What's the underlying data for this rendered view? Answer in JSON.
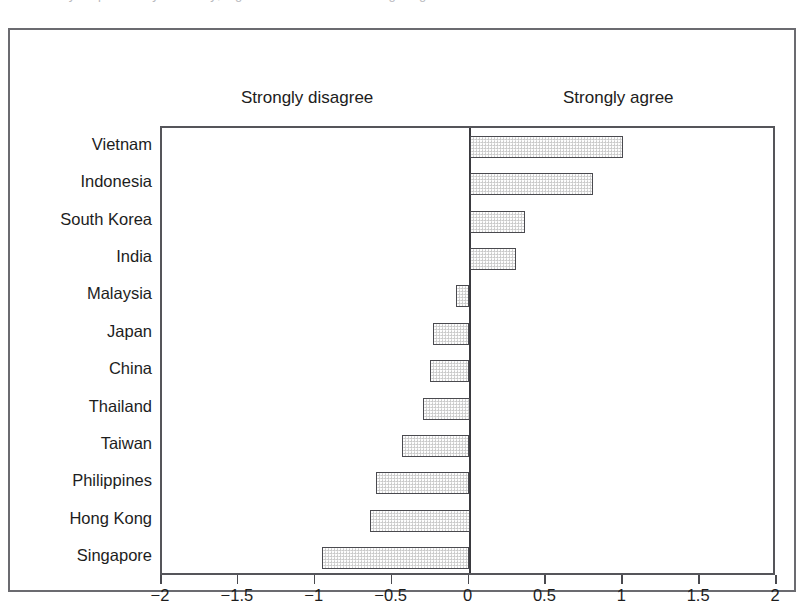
{
  "caption_sliver": "survey responses by economy; higher values indicate stronger agreement",
  "figure": {
    "pole_left_label": "Strongly disagree",
    "pole_right_label": "Strongly agree"
  },
  "colors": {
    "bar_fill": "#dcdcdc",
    "bar_border": "#4a4a4f",
    "axis": "#55555a",
    "frame": "#6b6b70",
    "text": "#1d1d1d",
    "background": "#ffffff"
  },
  "chart_data": {
    "type": "bar",
    "orientation": "horizontal",
    "title": "",
    "subtitle": "",
    "xlabel": "",
    "ylabel": "",
    "xlim": [
      -2,
      2
    ],
    "grid": false,
    "legend": false,
    "zero_line": 0,
    "pole_labels": {
      "negative": "Strongly disagree",
      "positive": "Strongly agree"
    },
    "xticks": [
      -2,
      -1.5,
      -1,
      -0.5,
      0,
      0.5,
      1,
      1.5,
      2
    ],
    "xtick_labels": [
      "−2",
      "−1.5",
      "−1",
      "−0.5",
      "0",
      "0.5",
      "1",
      "1.5",
      "2"
    ],
    "categories": [
      "Vietnam",
      "Indonesia",
      "South Korea",
      "India",
      "Malaysia",
      "Japan",
      "China",
      "Thailand",
      "Taiwan",
      "Philippines",
      "Hong Kong",
      "Singapore"
    ],
    "values": [
      1.0,
      0.8,
      0.36,
      0.3,
      -0.09,
      -0.24,
      -0.26,
      -0.3,
      -0.44,
      -0.61,
      -0.65,
      -0.96
    ]
  }
}
